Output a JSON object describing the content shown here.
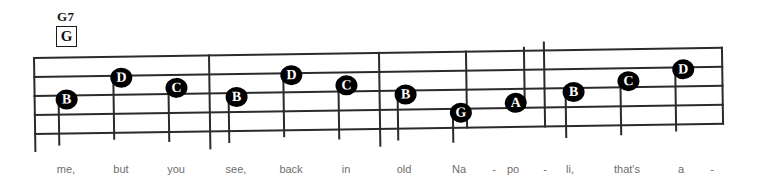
{
  "chord": {
    "name": "G7",
    "diagram_label": "G"
  },
  "staff": {
    "line_count": 5,
    "line_color": "#2b2b2b",
    "notehead_color": "#000000",
    "notehead_text_color": "#ffffff"
  },
  "barlines": [
    {
      "x": 0,
      "top": 0,
      "height": 95
    },
    {
      "x": 175,
      "top": 0,
      "height": 95
    },
    {
      "x": 345,
      "top": 0,
      "height": 95
    },
    {
      "x": 432,
      "top": 0,
      "height": 78
    },
    {
      "x": 510,
      "top": -8,
      "height": 86
    },
    {
      "x": 688,
      "top": 0,
      "height": 78
    }
  ],
  "notes": [
    {
      "label": "B",
      "x": 33,
      "y": 43,
      "stem_dir": "down",
      "stem_len": 46
    },
    {
      "label": "D",
      "x": 88,
      "y": 22,
      "stem_dir": "down",
      "stem_len": 62
    },
    {
      "label": "C",
      "x": 143,
      "y": 33,
      "stem_dir": "down",
      "stem_len": 54
    },
    {
      "label": "B",
      "x": 203,
      "y": 43,
      "stem_dir": "down",
      "stem_len": 46
    },
    {
      "label": "D",
      "x": 258,
      "y": 22,
      "stem_dir": "down",
      "stem_len": 62
    },
    {
      "label": "C",
      "x": 313,
      "y": 33,
      "stem_dir": "down",
      "stem_len": 54
    },
    {
      "label": "B",
      "x": 372,
      "y": 43,
      "stem_dir": "down",
      "stem_len": 46
    },
    {
      "label": "G",
      "x": 427,
      "y": 62,
      "stem_dir": "down",
      "stem_len": 30
    },
    {
      "label": "A",
      "x": 482,
      "y": 53,
      "stem_dir": "up",
      "stem_len": 56
    },
    {
      "label": "B",
      "x": 540,
      "y": 43,
      "stem_dir": "down",
      "stem_len": 46
    },
    {
      "label": "C",
      "x": 595,
      "y": 33,
      "stem_dir": "down",
      "stem_len": 54
    },
    {
      "label": "D",
      "x": 650,
      "y": 22,
      "stem_dir": "down",
      "stem_len": 62
    }
  ],
  "lyrics": [
    {
      "text": "me,",
      "x": 66
    },
    {
      "text": "but",
      "x": 121
    },
    {
      "text": "you",
      "x": 176
    },
    {
      "text": "see,",
      "x": 236
    },
    {
      "text": "back",
      "x": 291
    },
    {
      "text": "in",
      "x": 346
    },
    {
      "text": "old",
      "x": 404
    },
    {
      "text": "Na",
      "x": 459
    },
    {
      "text": "-",
      "x": 494
    },
    {
      "text": "po",
      "x": 513
    },
    {
      "text": "-",
      "x": 545
    },
    {
      "text": "li,",
      "x": 570
    },
    {
      "text": "that's",
      "x": 627
    },
    {
      "text": "a",
      "x": 681
    },
    {
      "text": "-",
      "x": 712
    }
  ]
}
